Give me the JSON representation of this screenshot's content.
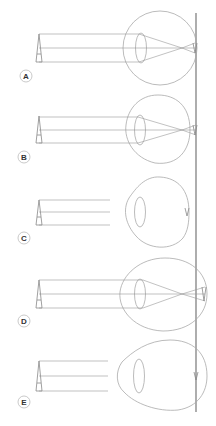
{
  "diagram": {
    "type": "eye-optics-refraction",
    "colors": {
      "line": "#8a8a8a",
      "eye": "#a9a9a9",
      "axis": "#777777",
      "label_ring": "#bbbbbb",
      "label_text": "#333333"
    },
    "retina_reference_line": {
      "x": 196,
      "y1": 13,
      "y2": 412
    },
    "panels": [
      {
        "id": "A",
        "label": "A",
        "description": "normal eye, image focused on retina"
      },
      {
        "id": "B",
        "label": "B",
        "description": "eye with rays focusing near retina"
      },
      {
        "id": "C",
        "label": "C",
        "description": "short eye, rays not drawn through"
      },
      {
        "id": "D",
        "label": "D",
        "description": "eye with focus in front of retina"
      },
      {
        "id": "E",
        "label": "E",
        "description": "elongated eye, rays not drawn through"
      }
    ]
  }
}
